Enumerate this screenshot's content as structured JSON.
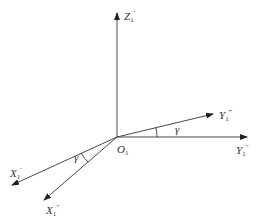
{
  "diagram": {
    "title": "",
    "origin": {
      "label": "O",
      "subscript": "1",
      "x": 117,
      "y": 137
    },
    "axes": [
      {
        "id": "z1-prime",
        "label": "Z",
        "subscript": "1",
        "prime": "′",
        "end": [
          117,
          12
        ]
      },
      {
        "id": "y1-triple-prime",
        "label": "Y",
        "subscript": "1",
        "prime": "‴",
        "end": [
          213,
          114
        ]
      },
      {
        "id": "y1-double-prime",
        "label": "Y",
        "subscript": "1",
        "prime": "″",
        "end": [
          247,
          137
        ]
      },
      {
        "id": "x1-prime",
        "label": "X",
        "subscript": "1",
        "prime": "′",
        "end": [
          12,
          185
        ]
      },
      {
        "id": "x1-double-prime",
        "label": "X",
        "subscript": "1",
        "prime": "″",
        "end": [
          44,
          200
        ]
      }
    ],
    "angles": [
      {
        "id": "gamma-y",
        "label": "γ",
        "between": [
          "y1-double-prime",
          "y1-triple-prime"
        ]
      },
      {
        "id": "gamma-x",
        "label": "γ",
        "between": [
          "x1-prime",
          "x1-double-prime"
        ]
      }
    ]
  }
}
